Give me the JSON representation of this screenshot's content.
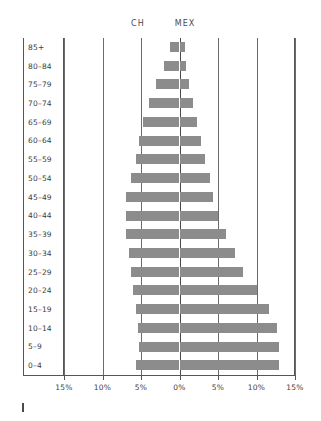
{
  "chart_data": {
    "type": "bar",
    "subtype": "population-pyramid",
    "title": "",
    "xlabel": "",
    "ylabel": "",
    "grid": true,
    "legend_position": "top",
    "xlim": [
      -15,
      15
    ],
    "xticks": [
      -15,
      -10,
      -5,
      0,
      5,
      10,
      15
    ],
    "xtick_labels": [
      "15%",
      "10%",
      "5%",
      "0%",
      "5%",
      "10%",
      "15%"
    ],
    "categories": [
      "85+",
      "80–84",
      "75–79",
      "70–74",
      "65–69",
      "60–64",
      "55–59",
      "50–54",
      "45–49",
      "40–44",
      "35–39",
      "30–34",
      "25–29",
      "20–24",
      "15–19",
      "10–14",
      "5–9",
      "0–4"
    ],
    "series": [
      {
        "name": "CH",
        "side": "left",
        "values": [
          1.2,
          2.0,
          3.0,
          3.9,
          4.7,
          5.2,
          5.7,
          6.3,
          6.9,
          6.9,
          7.0,
          6.5,
          6.3,
          6.0,
          5.6,
          5.4,
          5.3,
          5.6
        ]
      },
      {
        "name": "MEX",
        "side": "right",
        "values": [
          0.7,
          0.9,
          1.2,
          1.7,
          2.3,
          2.8,
          3.3,
          3.9,
          4.4,
          5.0,
          6.0,
          7.2,
          8.2,
          10.1,
          11.6,
          12.7,
          12.9,
          12.9
        ]
      }
    ],
    "bar_color": "#8c8c8c"
  },
  "legend": {
    "left_label": "CH",
    "right_label": "MEX"
  },
  "axis": {
    "tick_labels": [
      "15%",
      "10%",
      "5%",
      "0%",
      "5%",
      "10%",
      "15%"
    ]
  }
}
